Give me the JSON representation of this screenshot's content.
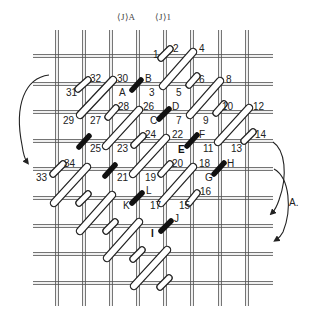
{
  "header": {
    "labels": [
      {
        "text": "⟨J⟩A",
        "x": 117,
        "y": 20
      },
      {
        "text": "⟨J⟩1",
        "x": 155,
        "y": 20
      }
    ]
  },
  "grid": {
    "columns_x": [
      57,
      84,
      111,
      138,
      165,
      192,
      220,
      247
    ],
    "rows_y": [
      56,
      84,
      112,
      141,
      169,
      198,
      226,
      254,
      283
    ],
    "v_extent": [
      30,
      306
    ],
    "h_extent": [
      33,
      273
    ],
    "color": "#555555"
  },
  "stitches": [
    {
      "type": "short",
      "x1": 161,
      "y1": 58,
      "x2": 170,
      "y2": 49
    },
    {
      "type": "long",
      "x1": 163,
      "y1": 86,
      "x2": 193,
      "y2": 52
    },
    {
      "type": "short",
      "x1": 189,
      "y1": 85,
      "x2": 197,
      "y2": 76
    },
    {
      "type": "long",
      "x1": 190,
      "y1": 115,
      "x2": 220,
      "y2": 81
    },
    {
      "type": "short",
      "x1": 216,
      "y1": 113,
      "x2": 224,
      "y2": 104
    },
    {
      "type": "long",
      "x1": 218,
      "y1": 142,
      "x2": 249,
      "y2": 108
    },
    {
      "type": "short",
      "x1": 244,
      "y1": 141,
      "x2": 253,
      "y2": 132
    },
    {
      "type": "short",
      "x1": 78,
      "y1": 89,
      "x2": 88,
      "y2": 80
    },
    {
      "type": "long",
      "x1": 80,
      "y1": 115,
      "x2": 113,
      "y2": 80
    },
    {
      "type": "black",
      "x1": 132,
      "y1": 90,
      "x2": 141,
      "y2": 80
    },
    {
      "type": "short",
      "x1": 108,
      "y1": 117,
      "x2": 116,
      "y2": 108
    },
    {
      "type": "long",
      "x1": 106,
      "y1": 146,
      "x2": 139,
      "y2": 110
    },
    {
      "type": "black",
      "x1": 159,
      "y1": 119,
      "x2": 169,
      "y2": 109
    },
    {
      "type": "short",
      "x1": 134,
      "y1": 145,
      "x2": 143,
      "y2": 136
    },
    {
      "type": "long",
      "x1": 133,
      "y1": 174,
      "x2": 166,
      "y2": 138
    },
    {
      "type": "black",
      "x1": 187,
      "y1": 146,
      "x2": 197,
      "y2": 135
    },
    {
      "type": "short",
      "x1": 161,
      "y1": 174,
      "x2": 170,
      "y2": 164
    },
    {
      "type": "long",
      "x1": 161,
      "y1": 203,
      "x2": 193,
      "y2": 167
    },
    {
      "type": "black",
      "x1": 214,
      "y1": 174,
      "x2": 224,
      "y2": 163
    },
    {
      "type": "short",
      "x1": 189,
      "y1": 203,
      "x2": 197,
      "y2": 193
    },
    {
      "type": "black",
      "x1": 79,
      "y1": 147,
      "x2": 89,
      "y2": 136
    },
    {
      "type": "short",
      "x1": 53,
      "y1": 174,
      "x2": 63,
      "y2": 164
    },
    {
      "type": "long",
      "x1": 54,
      "y1": 203,
      "x2": 87,
      "y2": 167
    },
    {
      "type": "black",
      "x1": 105,
      "y1": 176,
      "x2": 115,
      "y2": 165
    },
    {
      "type": "short",
      "x1": 79,
      "y1": 203,
      "x2": 88,
      "y2": 194
    },
    {
      "type": "long",
      "x1": 80,
      "y1": 231,
      "x2": 112,
      "y2": 195
    },
    {
      "type": "black",
      "x1": 132,
      "y1": 203,
      "x2": 142,
      "y2": 193
    },
    {
      "type": "short",
      "x1": 106,
      "y1": 231,
      "x2": 115,
      "y2": 222
    },
    {
      "type": "long",
      "x1": 107,
      "y1": 258,
      "x2": 139,
      "y2": 222
    },
    {
      "type": "black",
      "x1": 161,
      "y1": 231,
      "x2": 171,
      "y2": 221
    },
    {
      "type": "short",
      "x1": 133,
      "y1": 259,
      "x2": 142,
      "y2": 250
    },
    {
      "type": "long",
      "x1": 134,
      "y1": 286,
      "x2": 167,
      "y2": 250
    },
    {
      "type": "short",
      "x1": 160,
      "y1": 287,
      "x2": 169,
      "y2": 278
    }
  ],
  "labels": [
    {
      "text": "1",
      "x": 153,
      "y": 58
    },
    {
      "text": "2",
      "x": 173,
      "y": 52
    },
    {
      "text": "4",
      "x": 199,
      "y": 52
    },
    {
      "text": "3",
      "x": 149,
      "y": 96
    },
    {
      "text": "5",
      "x": 176,
      "y": 96
    },
    {
      "text": "6",
      "x": 199,
      "y": 83
    },
    {
      "text": "8",
      "x": 226,
      "y": 83
    },
    {
      "text": "7",
      "x": 176,
      "y": 124
    },
    {
      "text": "9",
      "x": 203,
      "y": 124
    },
    {
      "text": "10",
      "x": 222,
      "y": 110
    },
    {
      "text": "12",
      "x": 253,
      "y": 110
    },
    {
      "text": "11",
      "x": 203,
      "y": 152
    },
    {
      "text": "13",
      "x": 231,
      "y": 152
    },
    {
      "text": "14",
      "x": 255,
      "y": 138
    },
    {
      "text": "31",
      "x": 66,
      "y": 96
    },
    {
      "text": "32",
      "x": 90,
      "y": 82
    },
    {
      "text": "30",
      "x": 117,
      "y": 82
    },
    {
      "text": "A",
      "x": 119,
      "y": 96
    },
    {
      "text": "B",
      "x": 145,
      "y": 82
    },
    {
      "text": "29",
      "x": 63,
      "y": 124
    },
    {
      "text": "27",
      "x": 90,
      "y": 124
    },
    {
      "text": "28",
      "x": 118,
      "y": 110
    },
    {
      "text": "26",
      "x": 143,
      "y": 110
    },
    {
      "text": "C",
      "x": 150,
      "y": 124
    },
    {
      "text": "D",
      "x": 172,
      "y": 110
    },
    {
      "text": "25",
      "x": 90,
      "y": 152
    },
    {
      "text": "23",
      "x": 117,
      "y": 152
    },
    {
      "text": "24",
      "x": 145,
      "y": 138
    },
    {
      "text": "22",
      "x": 172,
      "y": 138
    },
    {
      "text": "E",
      "x": 178,
      "y": 153,
      "bold": true
    },
    {
      "text": "F",
      "x": 199,
      "y": 138
    },
    {
      "text": "21",
      "x": 117,
      "y": 181
    },
    {
      "text": "19",
      "x": 145,
      "y": 181
    },
    {
      "text": "20",
      "x": 172,
      "y": 167
    },
    {
      "text": "18",
      "x": 199,
      "y": 167
    },
    {
      "text": "G",
      "x": 205,
      "y": 181
    },
    {
      "text": "H",
      "x": 227,
      "y": 167
    },
    {
      "text": "33",
      "x": 36,
      "y": 181
    },
    {
      "text": "34",
      "x": 64,
      "y": 167
    },
    {
      "text": "K",
      "x": 123,
      "y": 209
    },
    {
      "text": "L",
      "x": 146,
      "y": 194
    },
    {
      "text": "17",
      "x": 150,
      "y": 209
    },
    {
      "text": "15",
      "x": 179,
      "y": 209
    },
    {
      "text": "16",
      "x": 200,
      "y": 195
    },
    {
      "text": "I",
      "x": 151,
      "y": 237,
      "bold": true
    },
    {
      "text": "J",
      "x": 174,
      "y": 222
    }
  ],
  "arrows": [
    {
      "name": "left-return-arrow",
      "d": "M 49 75 C 25 78, 14 105, 22 145 C 23 152, 24 158, 27 162"
    },
    {
      "name": "right-arrow-A-upper",
      "d": "M 273 142 C 285 150, 288 175, 279 200 C 277 206, 275 210, 272 213"
    },
    {
      "name": "right-arrow-A-lower",
      "d": "M 274 169 C 290 178, 292 210, 283 232 C 281 236, 279 238, 276 240"
    }
  ],
  "annotations": [
    {
      "text": "A.",
      "x": 289,
      "y": 206
    }
  ]
}
